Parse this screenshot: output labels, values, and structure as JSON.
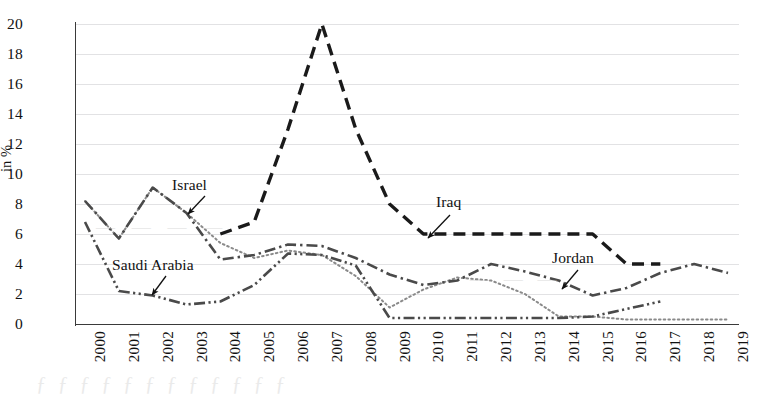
{
  "figure": {
    "y_axis_title": "in %",
    "ticks_y": [
      "0",
      "2",
      "4",
      "6",
      "8",
      "10",
      "12",
      "14",
      "16",
      "18",
      "20"
    ],
    "annotations": [
      {
        "name": "israel",
        "label": "Israel"
      },
      {
        "name": "saudi",
        "label": "Saudi Arabia"
      },
      {
        "name": "iraq",
        "label": "Iraq"
      },
      {
        "name": "jordan",
        "label": "Jordan"
      }
    ],
    "bleed_through": {
      "line1": "ƒ ƒ ƒ ƒ ƒ ƒ ƒ ƒ ƒ ƒ ƒ ƒ",
      "line2": "— — — —",
      "line3": "— — —"
    }
  },
  "chart_data": {
    "type": "line",
    "title": "",
    "xlabel": "",
    "ylabel": "in %",
    "ylim": [
      0,
      20
    ],
    "ytick_step": 2,
    "grid": true,
    "legend": "inline-annotations",
    "x": [
      2000,
      2001,
      2002,
      2003,
      2004,
      2005,
      2006,
      2007,
      2008,
      2009,
      2010,
      2011,
      2012,
      2013,
      2014,
      2015,
      2016,
      2017,
      2018,
      2019
    ],
    "categories": [
      "2000",
      "2001",
      "2002",
      "2003",
      "2004",
      "2005",
      "2006",
      "2007",
      "2008",
      "2009",
      "2010",
      "2011",
      "2012",
      "2013",
      "2014",
      "2015",
      "2016",
      "2017",
      "2018",
      "2019"
    ],
    "series": [
      {
        "name": "Israel",
        "style": "dotted",
        "color": "#8a8a8a",
        "x": [
          2000,
          2001,
          2002,
          2003,
          2004,
          2005,
          2006,
          2007,
          2008,
          2009,
          2010,
          2011,
          2012,
          2013,
          2014,
          2015,
          2016,
          2017,
          2018,
          2019
        ],
        "values": [
          8.2,
          5.7,
          9.1,
          7.4,
          5.4,
          4.4,
          4.9,
          4.6,
          3.2,
          1.1,
          2.3,
          3.1,
          2.9,
          2.0,
          0.5,
          0.5,
          0.3,
          0.3,
          0.3,
          0.3
        ]
      },
      {
        "name": "Iraq",
        "style": "dashed",
        "color": "#1a1a1a",
        "x": [
          2004,
          2005,
          2006,
          2007,
          2008,
          2009,
          2010,
          2011,
          2012,
          2013,
          2014,
          2015,
          2016,
          2017
        ],
        "values": [
          6.0,
          6.8,
          13.0,
          20.0,
          13.0,
          8.0,
          6.0,
          6.0,
          6.0,
          6.0,
          6.0,
          6.0,
          4.0,
          4.0
        ]
      },
      {
        "name": "Jordan",
        "style": "dash-dot",
        "color": "#4a4a4a",
        "x": [
          2000,
          2001,
          2002,
          2003,
          2004,
          2005,
          2006,
          2007,
          2008,
          2009,
          2010,
          2011,
          2012,
          2013,
          2014,
          2015,
          2016,
          2017,
          2018,
          2019
        ],
        "values": [
          8.2,
          5.7,
          9.1,
          7.4,
          4.3,
          4.6,
          5.3,
          5.2,
          4.4,
          3.3,
          2.6,
          2.9,
          4.0,
          3.5,
          2.9,
          1.9,
          2.4,
          3.4,
          4.0,
          3.4
        ]
      },
      {
        "name": "Saudi Arabia",
        "style": "dash-dot-dot",
        "color": "#4a4a4a",
        "x": [
          2000,
          2001,
          2002,
          2003,
          2004,
          2005,
          2006,
          2007,
          2008,
          2009,
          2010,
          2011,
          2012,
          2013,
          2014,
          2015,
          2016,
          2017
        ],
        "values": [
          6.8,
          2.2,
          1.9,
          1.3,
          1.5,
          2.6,
          4.7,
          4.6,
          3.9,
          0.4,
          0.4,
          0.4,
          0.4,
          0.4,
          0.4,
          0.5,
          1.0,
          1.5
        ]
      }
    ]
  }
}
